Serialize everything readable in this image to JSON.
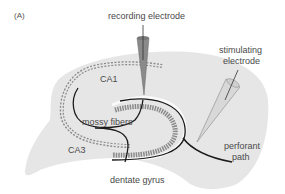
{
  "figure": {
    "panel_label": "(A)",
    "labels": {
      "recording_electrode": "recording electrode",
      "stimulating_electrode_line1": "stimulating",
      "stimulating_electrode_line2": "electrode",
      "ca1": "CA1",
      "ca3": "CA3",
      "mossy_fibers": "mossy fibers",
      "dentate_gyrus": "dentate gyrus",
      "perforant_path_line1": "perforant",
      "perforant_path_line2": "path"
    },
    "colors": {
      "slice": "#e6e6e6",
      "text": "#4a4a4a",
      "axon": "#1a1a1a",
      "neurons": "#888888",
      "electrode": "#8a8a8a"
    }
  }
}
